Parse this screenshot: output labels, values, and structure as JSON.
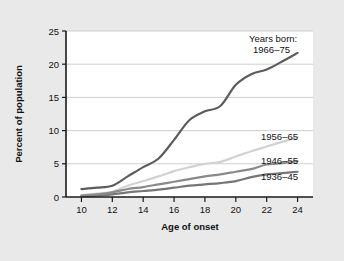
{
  "chart_data": {
    "type": "line",
    "title": "",
    "subtitle": "",
    "xlabel": "Age of onset",
    "ylabel": "Percent of population",
    "xlim": [
      9,
      25
    ],
    "ylim": [
      0,
      25
    ],
    "xticks": [
      "10",
      "12",
      "14",
      "16",
      "18",
      "20",
      "22",
      "24"
    ],
    "yticks": [
      "0",
      "5",
      "10",
      "15",
      "20",
      "25"
    ],
    "grid": "horizontal",
    "legend_position": "right-inline",
    "legend_heading": "Years born:",
    "x": [
      10,
      11,
      12,
      13,
      14,
      15,
      16,
      17,
      18,
      19,
      20,
      21,
      22,
      23,
      24
    ],
    "series": [
      {
        "name": "1966–75",
        "label": "1966–75",
        "color": "#5c5c5c",
        "values": [
          1.2,
          1.4,
          1.7,
          3.1,
          4.5,
          5.8,
          8.6,
          11.6,
          12.9,
          13.7,
          16.9,
          18.5,
          19.2,
          20.4,
          21.7
        ]
      },
      {
        "name": "1956–65",
        "label": "1956–65",
        "color": "#d2d2d2",
        "values": [
          0.3,
          0.5,
          0.8,
          1.7,
          2.4,
          3.1,
          3.9,
          4.5,
          5.0,
          5.3,
          6.1,
          6.9,
          7.6,
          8.3,
          9.0
        ]
      },
      {
        "name": "1946–55",
        "label": "1946–55",
        "color": "#8a8a8a",
        "values": [
          0.2,
          0.4,
          0.7,
          1.2,
          1.5,
          1.9,
          2.3,
          2.7,
          3.1,
          3.4,
          3.8,
          4.2,
          4.9,
          5.1,
          5.4
        ]
      },
      {
        "name": "1936–45",
        "label": "1936–45",
        "color": "#767676",
        "values": [
          0.1,
          0.2,
          0.4,
          0.7,
          0.9,
          1.1,
          1.4,
          1.7,
          1.9,
          2.1,
          2.4,
          3.0,
          3.4,
          3.6,
          3.8
        ]
      }
    ]
  },
  "plot": {
    "background": "#ffffff",
    "grid_color": "#c9c9c9",
    "axis_color": "#1a1a1a",
    "page_background": "#e9e9e9"
  }
}
